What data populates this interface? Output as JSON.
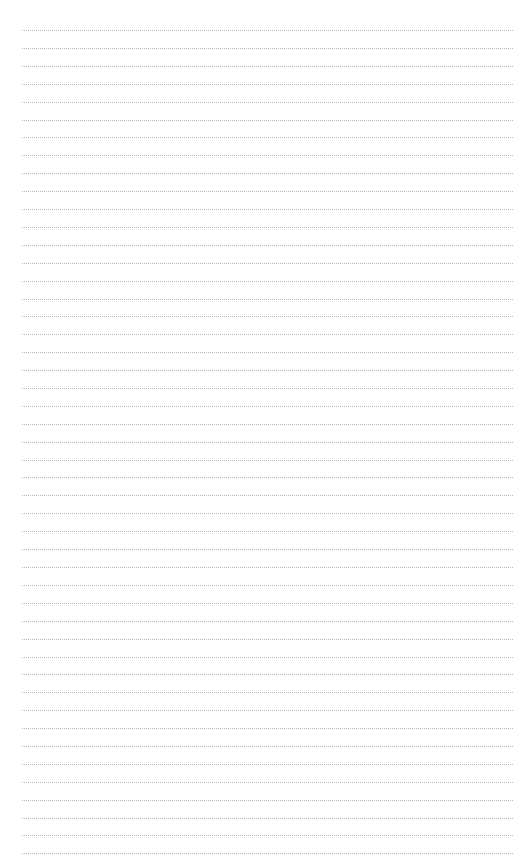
{
  "page": {
    "type": "blank lined paper",
    "background_color": "#ffffff",
    "rule_color": "#b8b8b8",
    "rule_style": "dotted",
    "rule_count": 47,
    "first_rule_y": 30,
    "rule_spacing": 17.9,
    "rule_left": 22,
    "rule_right": 513
  }
}
